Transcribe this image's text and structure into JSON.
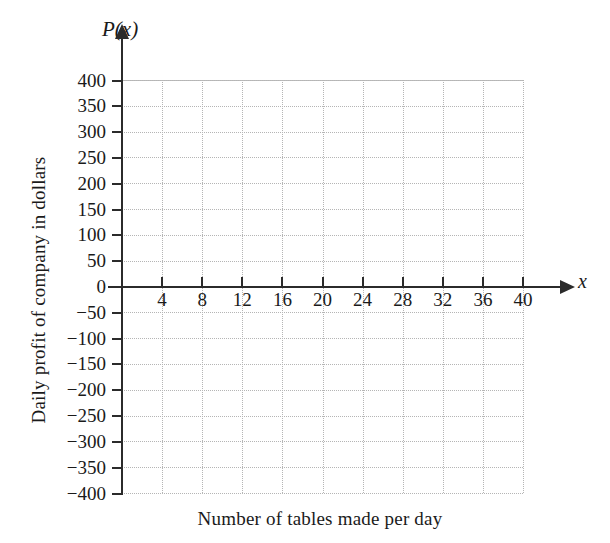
{
  "chart_data": {
    "type": "line",
    "title": "",
    "subtitle": "",
    "xlabel": "Number of tables made per day",
    "ylabel": "Daily profit of company in dollars",
    "x_axis_symbol": "x",
    "y_axis_symbol": "P(x)",
    "xlim": [
      0,
      40
    ],
    "ylim": [
      -400,
      400
    ],
    "xticks": [
      4,
      8,
      12,
      16,
      20,
      24,
      28,
      32,
      36,
      40
    ],
    "xtick_labels": [
      "4",
      "8",
      "12",
      "16",
      "20",
      "24",
      "28",
      "32",
      "36",
      "40"
    ],
    "yticks": [
      400,
      350,
      300,
      250,
      200,
      150,
      100,
      50,
      0,
      -50,
      -100,
      -150,
      -200,
      -250,
      -300,
      -350,
      -400
    ],
    "ytick_labels": [
      "400",
      "350",
      "300",
      "250",
      "200",
      "150",
      "100",
      "50",
      "0",
      "−50",
      "−100",
      "−150",
      "−200",
      "−250",
      "−300",
      "−350",
      "−400"
    ],
    "x_tick_step": 4,
    "y_tick_step": 50,
    "grid": true,
    "grid_style": "dotted",
    "grid_color": "#b5b5b5",
    "legend": null,
    "series": [],
    "annotations": [],
    "axis_color": "#2b2b2b",
    "background_color": "#ffffff",
    "note": "Empty coordinate grid with arrowed axes; no data plotted."
  }
}
